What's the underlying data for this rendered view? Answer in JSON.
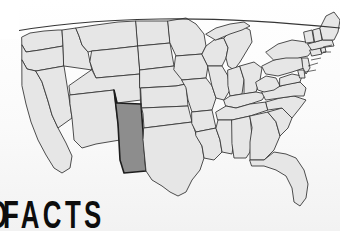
{
  "image": {
    "kind": "map-infographic",
    "subject": "United States state map with one state highlighted",
    "background_color": "#fbfbfb"
  },
  "headline": {
    "partial_letter": "D",
    "word": "FACTS",
    "full_visible_text": "D FACTS",
    "color": "#0d0d0d",
    "position": "bottom-left"
  },
  "overlay": {
    "corner_mask_label": "white-corner-mask",
    "corner_mask_color": "#ffffff"
  },
  "map": {
    "title": "United States",
    "state_fill": "#e6e6e6",
    "state_stroke": "#3a3a3a",
    "highlight_fill": "#8d8d8d",
    "highlight_stroke": "#1d1d1d",
    "highlighted_state": "New Mexico",
    "highlighted_state_abbr": "NM",
    "border_stroke": "#2b2b2b",
    "states": [
      {
        "abbr": "WA",
        "name": "Washington",
        "highlighted": false
      },
      {
        "abbr": "OR",
        "name": "Oregon",
        "highlighted": false
      },
      {
        "abbr": "CA",
        "name": "California",
        "highlighted": false
      },
      {
        "abbr": "NV",
        "name": "Nevada",
        "highlighted": false
      },
      {
        "abbr": "ID",
        "name": "Idaho",
        "highlighted": false
      },
      {
        "abbr": "MT",
        "name": "Montana",
        "highlighted": false
      },
      {
        "abbr": "WY",
        "name": "Wyoming",
        "highlighted": false
      },
      {
        "abbr": "UT",
        "name": "Utah",
        "highlighted": false
      },
      {
        "abbr": "AZ",
        "name": "Arizona",
        "highlighted": false
      },
      {
        "abbr": "CO",
        "name": "Colorado",
        "highlighted": false
      },
      {
        "abbr": "NM",
        "name": "New Mexico",
        "highlighted": true
      },
      {
        "abbr": "ND",
        "name": "North Dakota",
        "highlighted": false
      },
      {
        "abbr": "SD",
        "name": "South Dakota",
        "highlighted": false
      },
      {
        "abbr": "NE",
        "name": "Nebraska",
        "highlighted": false
      },
      {
        "abbr": "KS",
        "name": "Kansas",
        "highlighted": false
      },
      {
        "abbr": "OK",
        "name": "Oklahoma",
        "highlighted": false
      },
      {
        "abbr": "TX",
        "name": "Texas",
        "highlighted": false
      },
      {
        "abbr": "MN",
        "name": "Minnesota",
        "highlighted": false
      },
      {
        "abbr": "IA",
        "name": "Iowa",
        "highlighted": false
      },
      {
        "abbr": "MO",
        "name": "Missouri",
        "highlighted": false
      },
      {
        "abbr": "AR",
        "name": "Arkansas",
        "highlighted": false
      },
      {
        "abbr": "LA",
        "name": "Louisiana",
        "highlighted": false
      },
      {
        "abbr": "WI",
        "name": "Wisconsin",
        "highlighted": false
      },
      {
        "abbr": "IL",
        "name": "Illinois",
        "highlighted": false
      },
      {
        "abbr": "MI",
        "name": "Michigan",
        "highlighted": false
      },
      {
        "abbr": "IN",
        "name": "Indiana",
        "highlighted": false
      },
      {
        "abbr": "OH",
        "name": "Ohio",
        "highlighted": false
      },
      {
        "abbr": "KY",
        "name": "Kentucky",
        "highlighted": false
      },
      {
        "abbr": "TN",
        "name": "Tennessee",
        "highlighted": false
      },
      {
        "abbr": "MS",
        "name": "Mississippi",
        "highlighted": false
      },
      {
        "abbr": "AL",
        "name": "Alabama",
        "highlighted": false
      },
      {
        "abbr": "GA",
        "name": "Georgia",
        "highlighted": false
      },
      {
        "abbr": "FL",
        "name": "Florida",
        "highlighted": false
      },
      {
        "abbr": "SC",
        "name": "South Carolina",
        "highlighted": false
      },
      {
        "abbr": "NC",
        "name": "North Carolina",
        "highlighted": false
      },
      {
        "abbr": "VA",
        "name": "Virginia",
        "highlighted": false
      },
      {
        "abbr": "WV",
        "name": "West Virginia",
        "highlighted": false
      },
      {
        "abbr": "MD",
        "name": "Maryland",
        "highlighted": false
      },
      {
        "abbr": "DE",
        "name": "Delaware",
        "highlighted": false
      },
      {
        "abbr": "PA",
        "name": "Pennsylvania",
        "highlighted": false
      },
      {
        "abbr": "NJ",
        "name": "New Jersey",
        "highlighted": false
      },
      {
        "abbr": "NY",
        "name": "New York",
        "highlighted": false
      },
      {
        "abbr": "CT",
        "name": "Connecticut",
        "highlighted": false
      },
      {
        "abbr": "RI",
        "name": "Rhode Island",
        "highlighted": false
      },
      {
        "abbr": "MA",
        "name": "Massachusetts",
        "highlighted": false
      },
      {
        "abbr": "VT",
        "name": "Vermont",
        "highlighted": false
      },
      {
        "abbr": "NH",
        "name": "New Hampshire",
        "highlighted": false
      },
      {
        "abbr": "ME",
        "name": "Maine",
        "highlighted": false
      }
    ]
  }
}
